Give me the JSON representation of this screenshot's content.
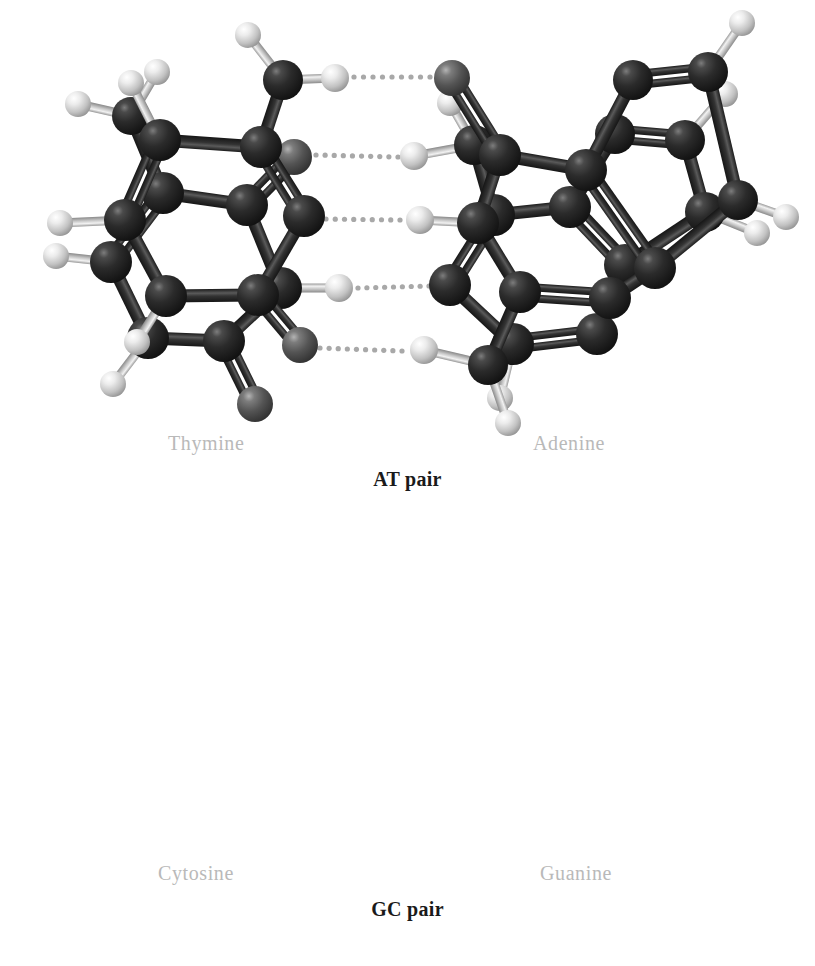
{
  "figure": {
    "background_color": "#ffffff"
  },
  "colors": {
    "dark_atom": "#262626",
    "dark_atom_highlight": "#8a8a8a",
    "oxygen_atom": "#555555",
    "oxygen_atom_highlight": "#b0b0b0",
    "hydrogen_atom": "#efefef",
    "hydrogen_atom_edge": "#8f8f8f",
    "bond_dark": "#2d2d2d",
    "bond_light": "#c9c9c9",
    "hbond_dot": "#a8a8a8",
    "label_gray": "#b9b9b9",
    "caption_black": "#1a1a1a"
  },
  "panels": [
    {
      "id": "at",
      "caption": "AT pair",
      "left_molecule": "Thymine",
      "right_molecule": "Adenine",
      "hydrogen_bond_count": 2
    },
    {
      "id": "gc",
      "caption": "GC pair",
      "left_molecule": "Cytosine",
      "right_molecule": "Guanine",
      "hydrogen_bond_count": 3
    }
  ],
  "labels": {
    "thymine": "Thymine",
    "adenine": "Adenine",
    "at_pair": "AT pair",
    "cytosine": "Cytosine",
    "guanine": "Guanine",
    "gc_pair": "GC pair"
  },
  "chart_data": {
    "type": "diagram",
    "panels": [
      {
        "name": "AT pair",
        "molecules": [
          {
            "name": "Thymine",
            "side": "left",
            "atoms": [
              {
                "id": "T-CH3",
                "element": "C",
                "x": 131,
                "y": 116,
                "r": 19
              },
              {
                "id": "T-H1",
                "element": "H",
                "x": 157,
                "y": 72,
                "r": 13
              },
              {
                "id": "T-H2",
                "element": "H",
                "x": 78,
                "y": 104,
                "r": 13
              },
              {
                "id": "T-C5",
                "element": "C",
                "x": 163,
                "y": 193,
                "r": 21
              },
              {
                "id": "T-C4",
                "element": "C",
                "x": 247,
                "y": 205,
                "r": 21
              },
              {
                "id": "T-O4",
                "element": "O",
                "x": 294,
                "y": 157,
                "r": 18
              },
              {
                "id": "T-C6",
                "element": "C",
                "x": 111,
                "y": 262,
                "r": 21
              },
              {
                "id": "T-H6",
                "element": "H",
                "x": 56,
                "y": 256,
                "r": 13
              },
              {
                "id": "T-N3",
                "element": "N",
                "x": 281,
                "y": 288,
                "r": 21
              },
              {
                "id": "T-H3",
                "element": "H",
                "x": 339,
                "y": 288,
                "r": 14
              },
              {
                "id": "T-N1",
                "element": "N",
                "x": 148,
                "y": 338,
                "r": 21
              },
              {
                "id": "T-C2",
                "element": "C",
                "x": 224,
                "y": 341,
                "r": 21
              },
              {
                "id": "T-O2",
                "element": "O",
                "x": 255,
                "y": 404,
                "r": 18
              },
              {
                "id": "T-H1N",
                "element": "H",
                "x": 113,
                "y": 384,
                "r": 13
              }
            ],
            "bonds": [
              {
                "a": "T-CH3",
                "b": "T-H1",
                "order": 1
              },
              {
                "a": "T-CH3",
                "b": "T-H2",
                "order": 1
              },
              {
                "a": "T-CH3",
                "b": "T-C5",
                "order": 1
              },
              {
                "a": "T-C5",
                "b": "T-C4",
                "order": 1
              },
              {
                "a": "T-C4",
                "b": "T-O4",
                "order": 2
              },
              {
                "a": "T-C5",
                "b": "T-C6",
                "order": 2
              },
              {
                "a": "T-C4",
                "b": "T-N3",
                "order": 1
              },
              {
                "a": "T-N3",
                "b": "T-H3",
                "order": 1
              },
              {
                "a": "T-C6",
                "b": "T-N1",
                "order": 1
              },
              {
                "a": "T-N1",
                "b": "T-C2",
                "order": 1
              },
              {
                "a": "T-N3",
                "b": "T-C2",
                "order": 1
              },
              {
                "a": "T-C2",
                "b": "T-O2",
                "order": 2
              },
              {
                "a": "T-C6",
                "b": "T-H6",
                "order": 1
              },
              {
                "a": "T-N1",
                "b": "T-H1N",
                "order": 1
              }
            ]
          },
          {
            "name": "Adenine",
            "side": "right",
            "atoms": [
              {
                "id": "A-N6",
                "element": "N",
                "x": 474,
                "y": 145,
                "r": 20
              },
              {
                "id": "A-H61",
                "element": "H",
                "x": 450,
                "y": 103,
                "r": 13
              },
              {
                "id": "A-H62",
                "element": "H",
                "x": 414,
                "y": 156,
                "r": 14
              },
              {
                "id": "A-C6",
                "element": "C",
                "x": 494,
                "y": 215,
                "r": 21
              },
              {
                "id": "A-C5",
                "element": "C",
                "x": 570,
                "y": 207,
                "r": 21
              },
              {
                "id": "A-N7",
                "element": "N",
                "x": 615,
                "y": 134,
                "r": 20
              },
              {
                "id": "A-C8",
                "element": "C",
                "x": 685,
                "y": 140,
                "r": 20
              },
              {
                "id": "A-H8",
                "element": "H",
                "x": 725,
                "y": 94,
                "r": 13
              },
              {
                "id": "A-N9",
                "element": "N",
                "x": 705,
                "y": 212,
                "r": 20
              },
              {
                "id": "A-H9",
                "element": "H",
                "x": 757,
                "y": 233,
                "r": 13
              },
              {
                "id": "A-C4",
                "element": "C",
                "x": 625,
                "y": 265,
                "r": 21
              },
              {
                "id": "A-N1",
                "element": "N",
                "x": 450,
                "y": 285,
                "r": 21
              },
              {
                "id": "A-C2",
                "element": "C",
                "x": 513,
                "y": 344,
                "r": 21
              },
              {
                "id": "A-H2",
                "element": "H",
                "x": 500,
                "y": 398,
                "r": 13
              },
              {
                "id": "A-N3",
                "element": "N",
                "x": 597,
                "y": 334,
                "r": 21
              }
            ],
            "bonds": [
              {
                "a": "A-N6",
                "b": "A-H61",
                "order": 1
              },
              {
                "a": "A-N6",
                "b": "A-H62",
                "order": 1
              },
              {
                "a": "A-N6",
                "b": "A-C6",
                "order": 1
              },
              {
                "a": "A-C6",
                "b": "A-C5",
                "order": 1
              },
              {
                "a": "A-C5",
                "b": "A-N7",
                "order": 1
              },
              {
                "a": "A-N7",
                "b": "A-C8",
                "order": 2
              },
              {
                "a": "A-C8",
                "b": "A-H8",
                "order": 1
              },
              {
                "a": "A-C8",
                "b": "A-N9",
                "order": 1
              },
              {
                "a": "A-N9",
                "b": "A-H9",
                "order": 1
              },
              {
                "a": "A-N9",
                "b": "A-C4",
                "order": 1
              },
              {
                "a": "A-C4",
                "b": "A-C5",
                "order": 2
              },
              {
                "a": "A-C6",
                "b": "A-N1",
                "order": 2
              },
              {
                "a": "A-N1",
                "b": "A-C2",
                "order": 1
              },
              {
                "a": "A-C2",
                "b": "A-H2",
                "order": 1
              },
              {
                "a": "A-C2",
                "b": "A-N3",
                "order": 2
              },
              {
                "a": "A-N3",
                "b": "A-C4",
                "order": 1
              }
            ]
          }
        ],
        "hydrogen_bonds": [
          {
            "from": "T-O4",
            "to": "A-H62",
            "x1": 316,
            "y1": 155,
            "x2": 398,
            "y2": 157
          },
          {
            "from": "T-H3",
            "to": "A-N1",
            "x1": 358,
            "y1": 288,
            "x2": 429,
            "y2": 286
          }
        ]
      },
      {
        "name": "GC pair",
        "molecules": [
          {
            "name": "Cytosine",
            "side": "left",
            "atoms": [
              {
                "id": "C-N4",
                "element": "N",
                "x": 283,
                "y": 570,
                "r": 20
              },
              {
                "id": "C-H41",
                "element": "H",
                "x": 248,
                "y": 525,
                "r": 13
              },
              {
                "id": "C-H42",
                "element": "H",
                "x": 335,
                "y": 568,
                "r": 14
              },
              {
                "id": "C-C4",
                "element": "C",
                "x": 261,
                "y": 637,
                "r": 21
              },
              {
                "id": "C-C5",
                "element": "C",
                "x": 160,
                "y": 630,
                "r": 21
              },
              {
                "id": "C-H5",
                "element": "H",
                "x": 131,
                "y": 573,
                "r": 13
              },
              {
                "id": "C-C6",
                "element": "C",
                "x": 125,
                "y": 710,
                "r": 21
              },
              {
                "id": "C-H6",
                "element": "H",
                "x": 60,
                "y": 713,
                "r": 13
              },
              {
                "id": "C-N3",
                "element": "N",
                "x": 304,
                "y": 706,
                "r": 21
              },
              {
                "id": "C-N1",
                "element": "N",
                "x": 166,
                "y": 786,
                "r": 21
              },
              {
                "id": "C-H1",
                "element": "H",
                "x": 137,
                "y": 832,
                "r": 13
              },
              {
                "id": "C-C2",
                "element": "C",
                "x": 258,
                "y": 785,
                "r": 21
              },
              {
                "id": "C-O2",
                "element": "O",
                "x": 300,
                "y": 835,
                "r": 18
              }
            ],
            "bonds": [
              {
                "a": "C-N4",
                "b": "C-H41",
                "order": 1
              },
              {
                "a": "C-N4",
                "b": "C-H42",
                "order": 1
              },
              {
                "a": "C-N4",
                "b": "C-C4",
                "order": 1
              },
              {
                "a": "C-C4",
                "b": "C-C5",
                "order": 1
              },
              {
                "a": "C-C5",
                "b": "C-H5",
                "order": 1
              },
              {
                "a": "C-C5",
                "b": "C-C6",
                "order": 2
              },
              {
                "a": "C-C6",
                "b": "C-H6",
                "order": 1
              },
              {
                "a": "C-C6",
                "b": "C-N1",
                "order": 1
              },
              {
                "a": "C-N1",
                "b": "C-H1",
                "order": 1
              },
              {
                "a": "C-N1",
                "b": "C-C2",
                "order": 1
              },
              {
                "a": "C-C2",
                "b": "C-N3",
                "order": 1
              },
              {
                "a": "C-N3",
                "b": "C-C4",
                "order": 2
              },
              {
                "a": "C-C2",
                "b": "C-O2",
                "order": 2
              }
            ]
          },
          {
            "name": "Guanine",
            "side": "right",
            "atoms": [
              {
                "id": "G-O6",
                "element": "O",
                "x": 452,
                "y": 568,
                "r": 18
              },
              {
                "id": "G-C6",
                "element": "C",
                "x": 500,
                "y": 645,
                "r": 21
              },
              {
                "id": "G-C5",
                "element": "C",
                "x": 586,
                "y": 660,
                "r": 21
              },
              {
                "id": "G-N7",
                "element": "N",
                "x": 633,
                "y": 570,
                "r": 20
              },
              {
                "id": "G-C8",
                "element": "C",
                "x": 708,
                "y": 562,
                "r": 20
              },
              {
                "id": "G-H8",
                "element": "H",
                "x": 742,
                "y": 513,
                "r": 13
              },
              {
                "id": "G-N9",
                "element": "N",
                "x": 738,
                "y": 690,
                "r": 20
              },
              {
                "id": "G-H9",
                "element": "H",
                "x": 786,
                "y": 707,
                "r": 13
              },
              {
                "id": "G-C4",
                "element": "C",
                "x": 655,
                "y": 758,
                "r": 21
              },
              {
                "id": "G-N1",
                "element": "N",
                "x": 478,
                "y": 713,
                "r": 21
              },
              {
                "id": "G-H1",
                "element": "H",
                "x": 420,
                "y": 710,
                "r": 14
              },
              {
                "id": "G-C2",
                "element": "C",
                "x": 520,
                "y": 782,
                "r": 21
              },
              {
                "id": "G-N3",
                "element": "N",
                "x": 610,
                "y": 788,
                "r": 21
              },
              {
                "id": "G-N2",
                "element": "N",
                "x": 488,
                "y": 855,
                "r": 20
              },
              {
                "id": "G-H21",
                "element": "H",
                "x": 424,
                "y": 840,
                "r": 14
              },
              {
                "id": "G-H22",
                "element": "H",
                "x": 508,
                "y": 913,
                "r": 13
              }
            ],
            "bonds": [
              {
                "a": "G-O6",
                "b": "G-C6",
                "order": 2
              },
              {
                "a": "G-C6",
                "b": "G-C5",
                "order": 1
              },
              {
                "a": "G-C5",
                "b": "G-N7",
                "order": 1
              },
              {
                "a": "G-N7",
                "b": "G-C8",
                "order": 2
              },
              {
                "a": "G-C8",
                "b": "G-H8",
                "order": 1
              },
              {
                "a": "G-C8",
                "b": "G-N9",
                "order": 1
              },
              {
                "a": "G-N9",
                "b": "G-H9",
                "order": 1
              },
              {
                "a": "G-N9",
                "b": "G-C4",
                "order": 1
              },
              {
                "a": "G-C4",
                "b": "G-C5",
                "order": 2
              },
              {
                "a": "G-C6",
                "b": "G-N1",
                "order": 1
              },
              {
                "a": "G-N1",
                "b": "G-H1",
                "order": 1
              },
              {
                "a": "G-N1",
                "b": "G-C2",
                "order": 1
              },
              {
                "a": "G-C2",
                "b": "G-N3",
                "order": 2
              },
              {
                "a": "G-N3",
                "b": "G-C4",
                "order": 1
              },
              {
                "a": "G-C2",
                "b": "G-N2",
                "order": 1
              },
              {
                "a": "G-N2",
                "b": "G-H21",
                "order": 1
              },
              {
                "a": "G-N2",
                "b": "G-H22",
                "order": 1
              }
            ]
          }
        ],
        "hydrogen_bonds": [
          {
            "from": "C-H42",
            "to": "G-O6",
            "x1": 354,
            "y1": 567,
            "x2": 430,
            "y2": 567
          },
          {
            "from": "C-N3",
            "to": "G-H1",
            "x1": 326,
            "y1": 709,
            "x2": 400,
            "y2": 710
          },
          {
            "from": "C-O2",
            "to": "G-H21",
            "x1": 320,
            "y1": 838,
            "x2": 402,
            "y2": 841
          }
        ]
      }
    ]
  }
}
